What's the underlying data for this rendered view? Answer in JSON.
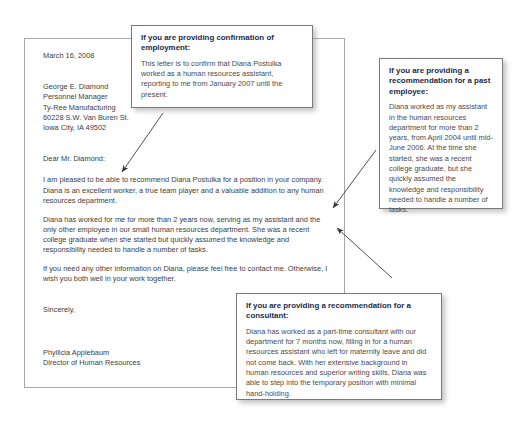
{
  "letter": {
    "date": "March 16, 2008",
    "recipient": [
      "George E. Diamond",
      "Personnel Manager",
      "Ty-Ree Manufacturing",
      "60228 S.W. Van Buren St.",
      "Iowa City, IA 49502"
    ],
    "salutation": "Dear Mr. Diamond:",
    "paragraphs": [
      "I am pleased to be able to recommend Diana Postulka for a position in your company. Diana is an excellent worker, a true team player and a valuable addition to any human resources department.",
      "Diana has worked for me for more than 2 years now, serving as my assistant and the only other employee in our small human resources department. She was a recent college graduate when she started but quickly assumed the knowledge and responsibility needed to handle a number of tasks.",
      "If you need any other information on Diana, please feel free to contact me. Otherwise, I wish you both well in your work together."
    ],
    "closing": "Sincerely,",
    "signer_name": "Phyllicia Applebaum",
    "signer_title": "Director of Human Resources"
  },
  "callouts": {
    "confirmation": {
      "title": "If you are providing confirmation of employment:",
      "text": "This letter is to confirm that Diana Postulka worked as a human resources assistant, reporting to me from January 2007 until the present."
    },
    "past_employee": {
      "title": "If you are providing a recommendation for a past employee:",
      "text": "Diana worked as my assistant in the human resources department for more than 2 years, from April 2004 until mid-June 2006. At the time she started, she was a recent college graduate, but she quickly assumed the knowledge and responsibility needed to handle a number of tasks."
    },
    "consultant": {
      "title": "If you are providing a recommendation for a consultant:",
      "text": "Diana has worked as a part-time consultant with our department for 7 months now, filling in for a human resources assistant who left for maternity leave and did not come back. With her extensive background in human resources and superior writing skills, Diana was able to step into the temporary position with minimal hand-holding."
    }
  },
  "colors": {
    "callout_heading": "#1b2a4a",
    "body_text": "#3d3d3d",
    "sheet_border": "#a8a8a8",
    "callout_border": "#7a7a7a"
  }
}
